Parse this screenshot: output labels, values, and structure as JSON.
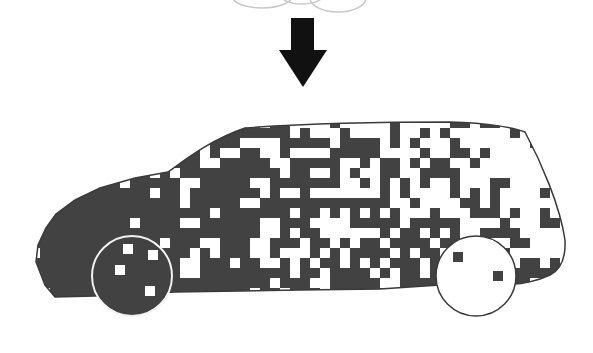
{
  "illustration": {
    "title": "Pixelated car dissolving under arrow",
    "colors": {
      "background": "#ffffff",
      "body_dark": "#424242",
      "pixel_light": "#ffffff",
      "arrow": "#111111",
      "cloud_stroke": "#c8c8c8",
      "wheel_outline_front": "#f2f2f2",
      "wheel_outline_rear": "#3a3a3a",
      "body_outline": "#3a3a3a"
    },
    "cloud": {
      "arcs": [
        {
          "cx": 262,
          "cy": -4,
          "rx": 30,
          "ry": 12
        },
        {
          "cx": 302,
          "cy": -6,
          "rx": 22,
          "ry": 10
        },
        {
          "cx": 338,
          "cy": -2,
          "rx": 28,
          "ry": 14
        }
      ]
    },
    "arrow": {
      "shaft": {
        "x": 291,
        "y": 18,
        "w": 23,
        "h": 34
      },
      "head": {
        "left": 279,
        "right": 327,
        "top": 50,
        "tip_x": 303,
        "tip_y": 87
      }
    },
    "car": {
      "outline_path": "M 55 297 L 45 285 L 36 262 L 38 245 L 46 228 L 56 214 L 75 200 L 100 188 L 135 178 L 168 172 C 185 160 210 140 245 128 C 300 124 380 122 450 122 C 490 123 515 128 525 132 C 540 160 560 205 565 240 C 566 260 560 270 550 275 C 535 282 520 284 515 284 L 440 285 L 380 289 L 300 290 L 175 292 L 95 296 Z",
      "grid": {
        "origin_x": 30,
        "origin_y": 118,
        "cell": 10,
        "cols": 55,
        "rows": 18,
        "seed": 1337,
        "light_prob_start": 0.05,
        "light_prob_end": 0.72,
        "x_start": 40,
        "x_end": 565
      },
      "front_wheel": {
        "cx": 132,
        "cy": 276,
        "r": 40,
        "fill": "#424242",
        "light_cells": [
          [
            123,
            244
          ],
          [
            148,
            250
          ],
          [
            115,
            265
          ],
          [
            145,
            286
          ]
        ]
      },
      "rear_wheel": {
        "cx": 476,
        "cy": 276,
        "r": 40,
        "fill": "#ffffff",
        "dark_cells": [
          [
            453,
            252
          ],
          [
            493,
            271
          ]
        ]
      }
    }
  }
}
